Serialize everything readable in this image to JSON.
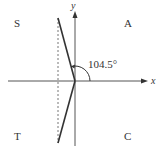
{
  "diagram": {
    "type": "cast-diagram",
    "colors": {
      "axis": "#555555",
      "ray": "#333333",
      "dashed": "#777777",
      "text": "#333333"
    },
    "axes": {
      "x_label": "x",
      "y_label": "y"
    },
    "quadrants": {
      "top_left": "S",
      "top_right": "A",
      "bottom_left": "T",
      "bottom_right": "C"
    },
    "angle": {
      "label": "104.5°",
      "value_deg": 104.5
    }
  }
}
